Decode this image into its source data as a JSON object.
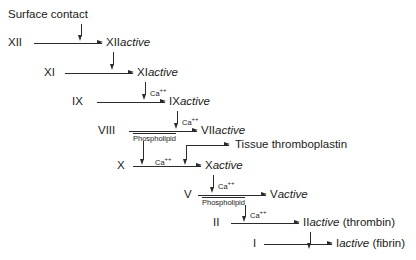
{
  "diagram": {
    "background_color": "#ffffff",
    "line_color": "#2a2a2a",
    "text_color": "#1a1a1a",
    "trigger": {
      "label": "Surface contact"
    },
    "annotations": {
      "calcium": "Ca",
      "calcium_charge": "++",
      "phospholipid": "Phospholipid"
    },
    "extras": {
      "tissue_thromboplastin": "Tissue thromboplastin"
    },
    "rows": [
      {
        "id": "row-xii",
        "factor": "XII",
        "product_prefix": "XII",
        "product_suffix": "active",
        "product_note": "",
        "above_arrow": "",
        "below_arrow": ""
      },
      {
        "id": "row-xi",
        "factor": "XI",
        "product_prefix": "XI",
        "product_suffix": "active",
        "product_note": "",
        "above_arrow": "",
        "below_arrow": ""
      },
      {
        "id": "row-ix",
        "factor": "IX",
        "product_prefix": "IX",
        "product_suffix": "active",
        "product_note": "",
        "above_arrow": "Ca++",
        "below_arrow": ""
      },
      {
        "id": "row-viii",
        "factor": "VIII",
        "product_prefix": "VII",
        "product_suffix": "active",
        "product_note": "",
        "above_arrow": "Ca++",
        "below_arrow": "Phospholipid"
      },
      {
        "id": "row-x",
        "factor": "X",
        "product_prefix": "X",
        "product_suffix": "active",
        "product_note": "",
        "above_arrow": "Ca++",
        "below_arrow": ""
      },
      {
        "id": "row-v",
        "factor": "V",
        "product_prefix": "V",
        "product_suffix": "active",
        "product_note": "",
        "above_arrow": "Ca++",
        "below_arrow": "Phospholipid"
      },
      {
        "id": "row-ii",
        "factor": "II",
        "product_prefix": "II",
        "product_suffix": "active",
        "product_note": "(thrombin)",
        "above_arrow": "Ca++",
        "below_arrow": ""
      },
      {
        "id": "row-i",
        "factor": "I",
        "product_prefix": "I",
        "product_suffix": "active",
        "product_note": "(fibrin)",
        "above_arrow": "",
        "below_arrow": ""
      }
    ]
  }
}
